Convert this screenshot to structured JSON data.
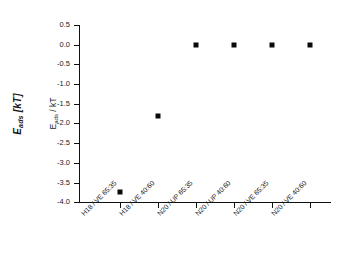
{
  "chart_data": {
    "type": "scatter",
    "title": "",
    "subtitle": "",
    "xlabel": "",
    "ylabel": "E_ads / kT",
    "ylabel_outer": "E_ads [kT]",
    "ylabel_outer_main": "E",
    "ylabel_outer_sub": "ads",
    "ylabel_outer_unit": " [kT]",
    "ylabel_inner_main": "E",
    "ylabel_inner_sub": "ads",
    "ylabel_inner_unit": " / kT",
    "categories": [
      "H18 / VE 65:35",
      "H18 / VE 40:60",
      "N20 / UP 65:35",
      "N20 / UP 40:60",
      "N20 / VE 65:35",
      "N20 / VE 40:60"
    ],
    "values": [
      -3.92,
      -1.82,
      0.0,
      0.0,
      0.0,
      0.0
    ],
    "ylim": [
      -4.25,
      0.5
    ],
    "yticks": [
      0.5,
      0.0,
      -0.5,
      -1.0,
      -1.5,
      -2.0,
      -2.5,
      -3.0,
      -3.5,
      -4.0
    ],
    "ytick_labels": [
      "0.5",
      "0.0",
      "-0.5",
      "-1.0",
      "-1.5",
      "-2.0",
      "-2.5",
      "-3.0",
      "-3.5",
      "-4.0"
    ],
    "grid": false,
    "legend": false,
    "legend_position": "none",
    "marker_symbol": "filled-square",
    "marker_color": "#0a0a0a",
    "axis_color": "#101010",
    "background_color": "#ffffff"
  },
  "geometry": {
    "plot_left": 79,
    "plot_right": 331,
    "plot_top": 25,
    "plot_bottom": 202,
    "ytick_pixels": [
      25,
      44.7,
      64.4,
      84.1,
      103.8,
      123.4,
      143.1,
      162.8,
      182.5,
      202.2
    ],
    "xtick_pixels": [
      120,
      158,
      196,
      234,
      272,
      310
    ],
    "marker_pixels_y": [
      192.4,
      116.0,
      44.7,
      44.7,
      44.7,
      44.7
    ]
  }
}
